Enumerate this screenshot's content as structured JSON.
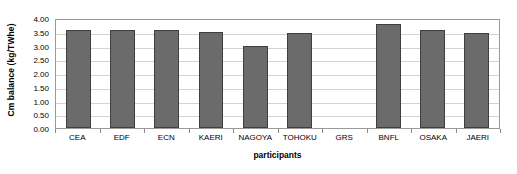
{
  "chart_data": {
    "type": "bar",
    "title": "",
    "xlabel": "participants",
    "ylabel": "Cm balance (kg/TWhe)",
    "categories": [
      "CEA",
      "EDF",
      "ECN",
      "KAERI",
      "NAGOYA",
      "TOHOKU",
      "GRS",
      "BNFL",
      "OSAKA",
      "JAERI"
    ],
    "values": [
      3.58,
      3.57,
      3.58,
      3.48,
      3.0,
      3.47,
      0.0,
      3.8,
      3.58,
      3.45
    ],
    "ylim": [
      0.0,
      4.0
    ],
    "ytick_labels": [
      "4.00",
      "3.50",
      "3.00",
      "2.50",
      "2.00",
      "1.50",
      "1.00",
      "0.50",
      "0.00"
    ],
    "ytick_values": [
      4.0,
      3.5,
      3.0,
      2.5,
      2.0,
      1.5,
      1.0,
      0.5,
      0.0
    ],
    "grid": true,
    "legend": "none",
    "series_color": "#6b6b6b",
    "series_border_color": "#3f3f3f",
    "gridline_color": "#d3d3d3",
    "axis_color": "#9a9a9a",
    "background_color": "#ffffff"
  }
}
